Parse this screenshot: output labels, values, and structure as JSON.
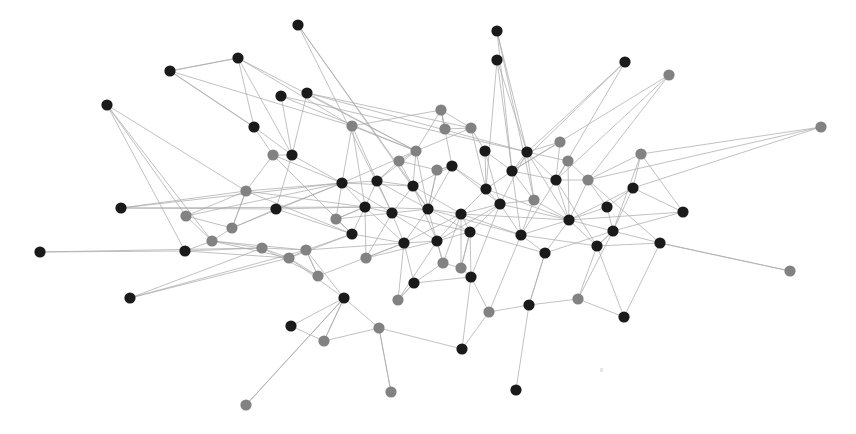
{
  "figure": {
    "type": "node-link-diagram",
    "width": 856,
    "height": 434,
    "background_color": "#ffffff"
  },
  "style": {
    "node_radius": 5.6,
    "node_color_dark": "#1a1a1a",
    "node_color_gray": "#828282",
    "edge_color": "#a9a9a9",
    "edge_width": 0.85,
    "edge_opacity": 0.85
  },
  "artifact": {
    "x": 600,
    "y": 368
  },
  "chart_data": {
    "type": "scatter",
    "xlabel": "",
    "ylabel": "",
    "xlim": [
      0,
      856
    ],
    "ylim": [
      0,
      434
    ],
    "grid": false,
    "legend": null,
    "node_count": 86,
    "edge_count": 243,
    "groups": [
      {
        "name": "dark",
        "color": "#1a1a1a",
        "count": 51
      },
      {
        "name": "gray",
        "color": "#828282",
        "count": 35
      }
    ],
    "nodes": [
      {
        "id": 0,
        "x": 298,
        "y": 25,
        "g": "dark"
      },
      {
        "id": 1,
        "x": 238,
        "y": 58,
        "g": "dark"
      },
      {
        "id": 2,
        "x": 170,
        "y": 71,
        "g": "dark"
      },
      {
        "id": 3,
        "x": 107,
        "y": 105,
        "g": "dark"
      },
      {
        "id": 4,
        "x": 281,
        "y": 96,
        "g": "dark"
      },
      {
        "id": 5,
        "x": 307,
        "y": 93,
        "g": "dark"
      },
      {
        "id": 6,
        "x": 497,
        "y": 60,
        "g": "dark"
      },
      {
        "id": 7,
        "x": 625,
        "y": 62,
        "g": "dark"
      },
      {
        "id": 8,
        "x": 669,
        "y": 75,
        "g": "gray"
      },
      {
        "id": 9,
        "x": 497,
        "y": 31,
        "g": "dark"
      },
      {
        "id": 10,
        "x": 273,
        "y": 155,
        "g": "gray"
      },
      {
        "id": 11,
        "x": 292,
        "y": 155,
        "g": "dark"
      },
      {
        "id": 12,
        "x": 352,
        "y": 126,
        "g": "gray"
      },
      {
        "id": 13,
        "x": 441,
        "y": 110,
        "g": "gray"
      },
      {
        "id": 14,
        "x": 471,
        "y": 128,
        "g": "gray"
      },
      {
        "id": 15,
        "x": 416,
        "y": 151,
        "g": "gray"
      },
      {
        "id": 16,
        "x": 527,
        "y": 152,
        "g": "dark"
      },
      {
        "id": 17,
        "x": 568,
        "y": 161,
        "g": "gray"
      },
      {
        "id": 18,
        "x": 641,
        "y": 154,
        "g": "gray"
      },
      {
        "id": 19,
        "x": 821,
        "y": 127,
        "g": "gray"
      },
      {
        "id": 20,
        "x": 121,
        "y": 208,
        "g": "dark"
      },
      {
        "id": 21,
        "x": 186,
        "y": 216,
        "g": "gray"
      },
      {
        "id": 22,
        "x": 246,
        "y": 191,
        "g": "gray"
      },
      {
        "id": 23,
        "x": 276,
        "y": 209,
        "g": "dark"
      },
      {
        "id": 24,
        "x": 342,
        "y": 183,
        "g": "dark"
      },
      {
        "id": 25,
        "x": 377,
        "y": 181,
        "g": "dark"
      },
      {
        "id": 26,
        "x": 413,
        "y": 186,
        "g": "dark"
      },
      {
        "id": 27,
        "x": 452,
        "y": 166,
        "g": "dark"
      },
      {
        "id": 28,
        "x": 486,
        "y": 189,
        "g": "dark"
      },
      {
        "id": 29,
        "x": 512,
        "y": 171,
        "g": "dark"
      },
      {
        "id": 30,
        "x": 556,
        "y": 180,
        "g": "dark"
      },
      {
        "id": 31,
        "x": 588,
        "y": 180,
        "g": "gray"
      },
      {
        "id": 32,
        "x": 607,
        "y": 207,
        "g": "dark"
      },
      {
        "id": 33,
        "x": 633,
        "y": 188,
        "g": "dark"
      },
      {
        "id": 34,
        "x": 683,
        "y": 212,
        "g": "dark"
      },
      {
        "id": 35,
        "x": 40,
        "y": 252,
        "g": "dark"
      },
      {
        "id": 36,
        "x": 185,
        "y": 251,
        "g": "dark"
      },
      {
        "id": 37,
        "x": 212,
        "y": 241,
        "g": "gray"
      },
      {
        "id": 38,
        "x": 262,
        "y": 248,
        "g": "gray"
      },
      {
        "id": 39,
        "x": 306,
        "y": 250,
        "g": "gray"
      },
      {
        "id": 40,
        "x": 352,
        "y": 234,
        "g": "dark"
      },
      {
        "id": 41,
        "x": 365,
        "y": 207,
        "g": "dark"
      },
      {
        "id": 42,
        "x": 392,
        "y": 213,
        "g": "dark"
      },
      {
        "id": 43,
        "x": 404,
        "y": 243,
        "g": "dark"
      },
      {
        "id": 44,
        "x": 428,
        "y": 209,
        "g": "dark"
      },
      {
        "id": 45,
        "x": 437,
        "y": 241,
        "g": "dark"
      },
      {
        "id": 46,
        "x": 461,
        "y": 214,
        "g": "dark"
      },
      {
        "id": 47,
        "x": 470,
        "y": 232,
        "g": "dark"
      },
      {
        "id": 48,
        "x": 500,
        "y": 204,
        "g": "dark"
      },
      {
        "id": 49,
        "x": 521,
        "y": 235,
        "g": "dark"
      },
      {
        "id": 50,
        "x": 545,
        "y": 253,
        "g": "dark"
      },
      {
        "id": 51,
        "x": 569,
        "y": 220,
        "g": "dark"
      },
      {
        "id": 52,
        "x": 597,
        "y": 246,
        "g": "dark"
      },
      {
        "id": 53,
        "x": 613,
        "y": 231,
        "g": "dark"
      },
      {
        "id": 54,
        "x": 660,
        "y": 243,
        "g": "dark"
      },
      {
        "id": 55,
        "x": 790,
        "y": 271,
        "g": "gray"
      },
      {
        "id": 56,
        "x": 130,
        "y": 298,
        "g": "dark"
      },
      {
        "id": 57,
        "x": 289,
        "y": 258,
        "g": "gray"
      },
      {
        "id": 58,
        "x": 344,
        "y": 298,
        "g": "dark"
      },
      {
        "id": 59,
        "x": 291,
        "y": 326,
        "g": "dark"
      },
      {
        "id": 60,
        "x": 324,
        "y": 341,
        "g": "gray"
      },
      {
        "id": 61,
        "x": 379,
        "y": 328,
        "g": "gray"
      },
      {
        "id": 62,
        "x": 414,
        "y": 283,
        "g": "dark"
      },
      {
        "id": 63,
        "x": 443,
        "y": 263,
        "g": "gray"
      },
      {
        "id": 64,
        "x": 461,
        "y": 268,
        "g": "gray"
      },
      {
        "id": 65,
        "x": 471,
        "y": 277,
        "g": "dark"
      },
      {
        "id": 66,
        "x": 462,
        "y": 349,
        "g": "dark"
      },
      {
        "id": 67,
        "x": 489,
        "y": 312,
        "g": "gray"
      },
      {
        "id": 68,
        "x": 529,
        "y": 305,
        "g": "dark"
      },
      {
        "id": 69,
        "x": 578,
        "y": 299,
        "g": "gray"
      },
      {
        "id": 70,
        "x": 624,
        "y": 317,
        "g": "dark"
      },
      {
        "id": 71,
        "x": 516,
        "y": 390,
        "g": "dark"
      },
      {
        "id": 72,
        "x": 391,
        "y": 392,
        "g": "gray"
      },
      {
        "id": 73,
        "x": 246,
        "y": 405,
        "g": "gray"
      },
      {
        "id": 74,
        "x": 437,
        "y": 170,
        "g": "gray"
      },
      {
        "id": 75,
        "x": 399,
        "y": 161,
        "g": "gray"
      },
      {
        "id": 76,
        "x": 366,
        "y": 258,
        "g": "gray"
      },
      {
        "id": 77,
        "x": 318,
        "y": 276,
        "g": "gray"
      },
      {
        "id": 78,
        "x": 398,
        "y": 300,
        "g": "gray"
      },
      {
        "id": 79,
        "x": 232,
        "y": 228,
        "g": "gray"
      },
      {
        "id": 80,
        "x": 336,
        "y": 219,
        "g": "gray"
      },
      {
        "id": 81,
        "x": 485,
        "y": 151,
        "g": "dark"
      },
      {
        "id": 82,
        "x": 534,
        "y": 200,
        "g": "gray"
      },
      {
        "id": 83,
        "x": 445,
        "y": 129,
        "g": "gray"
      },
      {
        "id": 84,
        "x": 254,
        "y": 127,
        "g": "dark"
      },
      {
        "id": 85,
        "x": 560,
        "y": 142,
        "g": "gray"
      }
    ],
    "edges": [
      [
        0,
        26
      ],
      [
        0,
        44
      ],
      [
        1,
        84
      ],
      [
        1,
        2
      ],
      [
        1,
        11
      ],
      [
        2,
        1
      ],
      [
        2,
        84
      ],
      [
        3,
        21
      ],
      [
        3,
        22
      ],
      [
        4,
        11
      ],
      [
        4,
        16
      ],
      [
        5,
        11
      ],
      [
        5,
        15
      ],
      [
        5,
        16
      ],
      [
        6,
        29
      ],
      [
        6,
        16
      ],
      [
        7,
        29
      ],
      [
        7,
        16
      ],
      [
        8,
        29
      ],
      [
        8,
        30
      ],
      [
        9,
        16
      ],
      [
        9,
        29
      ],
      [
        10,
        22
      ],
      [
        10,
        24
      ],
      [
        11,
        23
      ],
      [
        11,
        10
      ],
      [
        12,
        13
      ],
      [
        12,
        24
      ],
      [
        12,
        15
      ],
      [
        13,
        14
      ],
      [
        13,
        15
      ],
      [
        13,
        83
      ],
      [
        14,
        15
      ],
      [
        14,
        81
      ],
      [
        15,
        26
      ],
      [
        15,
        24
      ],
      [
        15,
        25
      ],
      [
        16,
        29
      ],
      [
        16,
        82
      ],
      [
        16,
        17
      ],
      [
        16,
        30
      ],
      [
        17,
        30
      ],
      [
        17,
        31
      ],
      [
        18,
        33
      ],
      [
        18,
        31
      ],
      [
        19,
        31
      ],
      [
        19,
        33
      ],
      [
        20,
        23
      ],
      [
        20,
        24
      ],
      [
        21,
        37
      ],
      [
        21,
        79
      ],
      [
        22,
        24
      ],
      [
        22,
        79
      ],
      [
        23,
        24
      ],
      [
        23,
        41
      ],
      [
        24,
        25
      ],
      [
        24,
        41
      ],
      [
        24,
        26
      ],
      [
        25,
        26
      ],
      [
        25,
        41
      ],
      [
        25,
        42
      ],
      [
        26,
        27
      ],
      [
        26,
        44
      ],
      [
        26,
        42
      ],
      [
        27,
        28
      ],
      [
        27,
        44
      ],
      [
        27,
        74
      ],
      [
        28,
        29
      ],
      [
        28,
        46
      ],
      [
        28,
        48
      ],
      [
        29,
        30
      ],
      [
        29,
        82
      ],
      [
        30,
        31
      ],
      [
        30,
        51
      ],
      [
        31,
        32
      ],
      [
        31,
        51
      ],
      [
        32,
        33
      ],
      [
        32,
        53
      ],
      [
        33,
        34
      ],
      [
        33,
        53
      ],
      [
        34,
        53
      ],
      [
        34,
        51
      ],
      [
        35,
        36
      ],
      [
        36,
        37
      ],
      [
        36,
        38
      ],
      [
        37,
        38
      ],
      [
        37,
        79
      ],
      [
        38,
        39
      ],
      [
        38,
        57
      ],
      [
        39,
        40
      ],
      [
        39,
        57
      ],
      [
        39,
        77
      ],
      [
        40,
        41
      ],
      [
        40,
        80
      ],
      [
        41,
        42
      ],
      [
        41,
        80
      ],
      [
        42,
        43
      ],
      [
        42,
        44
      ],
      [
        43,
        44
      ],
      [
        43,
        45
      ],
      [
        43,
        62
      ],
      [
        44,
        45
      ],
      [
        44,
        46
      ],
      [
        44,
        74
      ],
      [
        45,
        46
      ],
      [
        45,
        47
      ],
      [
        45,
        63
      ],
      [
        46,
        47
      ],
      [
        46,
        48
      ],
      [
        47,
        48
      ],
      [
        47,
        64
      ],
      [
        48,
        49
      ],
      [
        48,
        82
      ],
      [
        49,
        50
      ],
      [
        49,
        51
      ],
      [
        50,
        51
      ],
      [
        50,
        68
      ],
      [
        51,
        52
      ],
      [
        52,
        53
      ],
      [
        52,
        54
      ],
      [
        53,
        54
      ],
      [
        54,
        55
      ],
      [
        55,
        54
      ],
      [
        56,
        38
      ],
      [
        56,
        39
      ],
      [
        57,
        58
      ],
      [
        57,
        77
      ],
      [
        58,
        59
      ],
      [
        58,
        60
      ],
      [
        58,
        61
      ],
      [
        58,
        73
      ],
      [
        59,
        60
      ],
      [
        60,
        61
      ],
      [
        61,
        72
      ],
      [
        62,
        63
      ],
      [
        62,
        78
      ],
      [
        63,
        64
      ],
      [
        64,
        65
      ],
      [
        65,
        67
      ],
      [
        66,
        65
      ],
      [
        67,
        68
      ],
      [
        68,
        69
      ],
      [
        69,
        70
      ],
      [
        70,
        54
      ],
      [
        71,
        68
      ],
      [
        72,
        61
      ],
      [
        73,
        58
      ],
      [
        74,
        75
      ],
      [
        74,
        44
      ],
      [
        75,
        26
      ],
      [
        75,
        15
      ],
      [
        76,
        43
      ],
      [
        76,
        42
      ],
      [
        77,
        39
      ],
      [
        78,
        43
      ],
      [
        79,
        23
      ],
      [
        80,
        41
      ],
      [
        81,
        29
      ],
      [
        81,
        28
      ],
      [
        82,
        49
      ],
      [
        83,
        13
      ],
      [
        84,
        10
      ],
      [
        85,
        30
      ],
      [
        85,
        16
      ],
      [
        3,
        36
      ],
      [
        2,
        12
      ],
      [
        1,
        15
      ],
      [
        20,
        41
      ],
      [
        21,
        24
      ],
      [
        35,
        38
      ],
      [
        56,
        57
      ],
      [
        19,
        18
      ],
      [
        8,
        31
      ],
      [
        7,
        30
      ],
      [
        6,
        28
      ],
      [
        0,
        42
      ],
      [
        9,
        82
      ],
      [
        10,
        40
      ],
      [
        11,
        24
      ],
      [
        12,
        25
      ],
      [
        13,
        27
      ],
      [
        14,
        28
      ],
      [
        16,
        48
      ],
      [
        17,
        51
      ],
      [
        18,
        53
      ],
      [
        22,
        41
      ],
      [
        23,
        40
      ],
      [
        24,
        42
      ],
      [
        25,
        44
      ],
      [
        26,
        46
      ],
      [
        27,
        48
      ],
      [
        28,
        51
      ],
      [
        29,
        49
      ],
      [
        30,
        52
      ],
      [
        31,
        54
      ],
      [
        37,
        57
      ],
      [
        38,
        77
      ],
      [
        39,
        58
      ],
      [
        40,
        43
      ],
      [
        41,
        44
      ],
      [
        42,
        45
      ],
      [
        43,
        46
      ],
      [
        44,
        47
      ],
      [
        45,
        48
      ],
      [
        46,
        49
      ],
      [
        47,
        50
      ],
      [
        48,
        51
      ],
      [
        49,
        52
      ],
      [
        50,
        53
      ],
      [
        51,
        53
      ],
      [
        52,
        70
      ],
      [
        53,
        69
      ],
      [
        62,
        65
      ],
      [
        63,
        46
      ],
      [
        64,
        47
      ],
      [
        65,
        48
      ],
      [
        67,
        49
      ],
      [
        68,
        50
      ],
      [
        69,
        52
      ],
      [
        74,
        27
      ],
      [
        75,
        25
      ],
      [
        76,
        41
      ],
      [
        78,
        62
      ],
      [
        79,
        22
      ],
      [
        80,
        24
      ],
      [
        81,
        48
      ],
      [
        82,
        51
      ],
      [
        83,
        14
      ],
      [
        84,
        11
      ],
      [
        85,
        29
      ],
      [
        15,
        44
      ],
      [
        26,
        45
      ],
      [
        41,
        43
      ],
      [
        42,
        47
      ],
      [
        44,
        49
      ],
      [
        46,
        51
      ],
      [
        12,
        41
      ],
      [
        22,
        40
      ],
      [
        57,
        40
      ],
      [
        39,
        43
      ],
      [
        77,
        43
      ],
      [
        60,
        58
      ],
      [
        61,
        66
      ],
      [
        67,
        66
      ],
      [
        65,
        47
      ],
      [
        63,
        45
      ],
      [
        64,
        46
      ],
      [
        76,
        45
      ],
      [
        78,
        45
      ],
      [
        80,
        42
      ],
      [
        79,
        24
      ],
      [
        21,
        22
      ],
      [
        37,
        39
      ],
      [
        36,
        57
      ],
      [
        20,
        22
      ],
      [
        3,
        37
      ],
      [
        2,
        84
      ],
      [
        1,
        12
      ],
      [
        5,
        14
      ],
      [
        4,
        15
      ],
      [
        16,
        51
      ],
      [
        30,
        49
      ],
      [
        33,
        51
      ],
      [
        18,
        34
      ],
      [
        32,
        51
      ],
      [
        53,
        52
      ]
    ]
  }
}
